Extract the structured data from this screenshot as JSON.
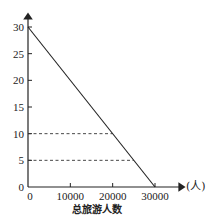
{
  "chart_data": {
    "type": "line",
    "title": "",
    "xlabel": "总旅游人数",
    "xunit": "(人)",
    "ylabel": "",
    "xlim": [
      0,
      30000
    ],
    "ylim": [
      0,
      30
    ],
    "xticks": [
      0,
      10000,
      20000,
      30000
    ],
    "xtick_labels": [
      "0",
      "10000",
      "20000",
      "30000"
    ],
    "yticks": [
      0,
      5,
      10,
      15,
      20,
      25,
      30
    ],
    "ytick_labels": [
      "0",
      "5",
      "10",
      "15",
      "20",
      "25",
      "30"
    ],
    "grid": false,
    "series": [
      {
        "name": "line",
        "x": [
          0,
          30000
        ],
        "y": [
          30,
          0
        ],
        "style": "solid"
      }
    ],
    "reference_lines": [
      {
        "y": 10,
        "x_end": 20000,
        "style": "dashed"
      },
      {
        "y": 5,
        "x_end": 25000,
        "style": "dashed"
      }
    ],
    "origin_labels": {
      "x": "0",
      "y": "0"
    }
  }
}
